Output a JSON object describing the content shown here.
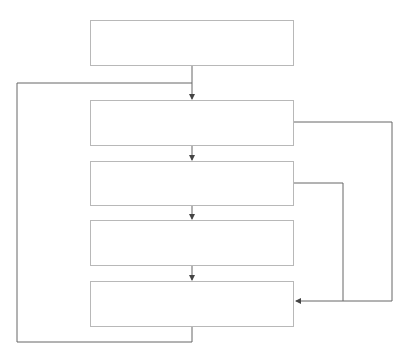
{
  "diagram": {
    "type": "flowchart",
    "boxes": [
      {
        "id": "box-1",
        "label": ""
      },
      {
        "id": "box-2",
        "label": ""
      },
      {
        "id": "box-3",
        "label": ""
      },
      {
        "id": "box-4",
        "label": ""
      },
      {
        "id": "box-5",
        "label": ""
      }
    ],
    "edges": [
      {
        "from": "box-1",
        "to": "box-2",
        "style": "arrow-down"
      },
      {
        "from": "box-2",
        "to": "box-3",
        "style": "arrow-down"
      },
      {
        "from": "box-3",
        "to": "box-4",
        "style": "arrow-down"
      },
      {
        "from": "box-4",
        "to": "box-5",
        "style": "arrow-down"
      },
      {
        "from": "box-2",
        "to": "box-5",
        "style": "right-loop-outer"
      },
      {
        "from": "box-3",
        "to": "box-5",
        "style": "right-loop-inner"
      },
      {
        "from": "box-5",
        "to": "box-2",
        "style": "left-loop-feedback"
      }
    ],
    "colors": {
      "box_border": "#b8b8b8",
      "line": "#555555"
    }
  }
}
